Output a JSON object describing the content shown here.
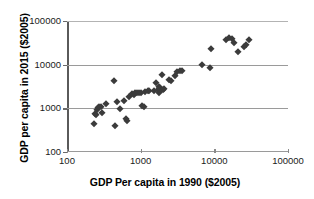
{
  "chart_data": {
    "type": "scatter",
    "title": "",
    "xlabel": "GDP Per capita in 1990 ($2005)",
    "ylabel": "GDP per capita in 2015 ($2005)",
    "xscale": "log",
    "yscale": "log",
    "xlim": [
      100,
      100000
    ],
    "ylim": [
      100,
      100000
    ],
    "xticks": [
      100,
      1000,
      10000,
      100000
    ],
    "xtick_labels": [
      "100",
      "1000",
      "10000",
      "100000"
    ],
    "yticks": [
      100,
      1000,
      10000,
      100000
    ],
    "ytick_labels": [
      "100",
      "1000",
      "10000",
      "100000"
    ],
    "grid": "horizontal",
    "legend": "none",
    "marker": "diamond",
    "marker_color": "#3b3b3b",
    "series": [
      {
        "name": "Countries",
        "points": [
          [
            230,
            430
          ],
          [
            240,
            760
          ],
          [
            250,
            700
          ],
          [
            255,
            900
          ],
          [
            265,
            1000
          ],
          [
            270,
            1050
          ],
          [
            285,
            1080
          ],
          [
            300,
            800
          ],
          [
            340,
            1250
          ],
          [
            430,
            4200
          ],
          [
            450,
            400
          ],
          [
            480,
            1400
          ],
          [
            520,
            950
          ],
          [
            600,
            1500
          ],
          [
            640,
            560
          ],
          [
            660,
            520
          ],
          [
            700,
            1800
          ],
          [
            760,
            2100
          ],
          [
            800,
            2050
          ],
          [
            830,
            2200
          ],
          [
            900,
            2250
          ],
          [
            950,
            2200
          ],
          [
            1000,
            2300
          ],
          [
            1050,
            1150
          ],
          [
            1100,
            1100
          ],
          [
            1150,
            2400
          ],
          [
            1250,
            2500
          ],
          [
            1300,
            2450
          ],
          [
            1500,
            2550
          ],
          [
            1600,
            3900
          ],
          [
            1700,
            2600
          ],
          [
            1750,
            2300
          ],
          [
            1800,
            3000
          ],
          [
            1850,
            2900
          ],
          [
            1900,
            2650
          ],
          [
            1950,
            5800
          ],
          [
            2000,
            2600
          ],
          [
            2100,
            2700
          ],
          [
            2400,
            4500
          ],
          [
            2600,
            4300
          ],
          [
            2900,
            5400
          ],
          [
            3100,
            6800
          ],
          [
            3400,
            7000
          ],
          [
            3600,
            7200
          ],
          [
            6800,
            9900
          ],
          [
            8800,
            8200
          ],
          [
            9000,
            23000
          ],
          [
            14500,
            37000
          ],
          [
            16000,
            40000
          ],
          [
            17500,
            38000
          ],
          [
            18500,
            31000
          ],
          [
            21000,
            19500
          ],
          [
            25000,
            26000
          ],
          [
            27000,
            27500
          ],
          [
            30000,
            36000
          ]
        ]
      }
    ]
  }
}
